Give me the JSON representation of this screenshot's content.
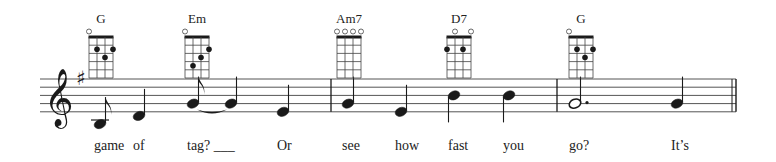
{
  "score": {
    "clef": "treble",
    "key_signature": {
      "name": "G major",
      "accidental": "sharp",
      "symbol": "♯",
      "count": 1
    },
    "measures": [
      {
        "index": 0,
        "notes": [
          {
            "pitch": "B3",
            "duration": "eighth",
            "dotted": false,
            "tie_to_next": false
          },
          {
            "pitch": "D4",
            "duration": "quarter",
            "dotted": false,
            "tie_to_next": false
          },
          {
            "pitch": "G4",
            "duration": "eighth",
            "dotted": false,
            "tie_to_next": true
          },
          {
            "pitch": "G4",
            "duration": "quarter",
            "dotted": false,
            "tie_to_next": false
          },
          {
            "pitch": "E4",
            "duration": "quarter",
            "dotted": false,
            "tie_to_next": false
          }
        ]
      },
      {
        "index": 1,
        "notes": [
          {
            "pitch": "G4",
            "duration": "quarter",
            "dotted": false,
            "tie_to_next": false
          },
          {
            "pitch": "E4",
            "duration": "quarter",
            "dotted": false,
            "tie_to_next": false
          },
          {
            "pitch": "B4",
            "duration": "quarter",
            "dotted": false,
            "tie_to_next": false
          },
          {
            "pitch": "B4",
            "duration": "quarter",
            "dotted": false,
            "tie_to_next": false
          }
        ]
      },
      {
        "index": 2,
        "notes": [
          {
            "pitch": "G4",
            "duration": "half",
            "dotted": true,
            "tie_to_next": false
          },
          {
            "pitch": "G4",
            "duration": "quarter",
            "dotted": false,
            "tie_to_next": false
          }
        ]
      }
    ],
    "final_barline": "double",
    "chords": [
      {
        "name": "G",
        "at_note": 0,
        "open": [
          true,
          false,
          false,
          false
        ],
        "fingers": [
          {
            "string": 2,
            "fret": 2
          },
          {
            "string": 3,
            "fret": 3
          },
          {
            "string": 4,
            "fret": 2
          }
        ]
      },
      {
        "name": "Em",
        "at_note": 2,
        "open": [
          true,
          false,
          false,
          false
        ],
        "fingers": [
          {
            "string": 2,
            "fret": 4
          },
          {
            "string": 3,
            "fret": 3
          },
          {
            "string": 4,
            "fret": 2
          }
        ]
      },
      {
        "name": "Am7",
        "at_note": 5,
        "open": [
          true,
          true,
          true,
          true
        ],
        "fingers": []
      },
      {
        "name": "D7",
        "at_note": 7,
        "open": [
          false,
          true,
          false,
          true
        ],
        "fingers": [
          {
            "string": 1,
            "fret": 2
          },
          {
            "string": 3,
            "fret": 2
          }
        ]
      },
      {
        "name": "G",
        "at_note": 9,
        "open": [
          true,
          false,
          false,
          false
        ],
        "fingers": [
          {
            "string": 2,
            "fret": 2
          },
          {
            "string": 3,
            "fret": 3
          },
          {
            "string": 4,
            "fret": 2
          }
        ]
      }
    ],
    "lyrics": [
      {
        "text": "game",
        "at_note": 0
      },
      {
        "text": "of",
        "at_note": 1
      },
      {
        "text": "tag? ___",
        "at_note": 2
      },
      {
        "text": "Or",
        "at_note": 4
      },
      {
        "text": "see",
        "at_note": 5
      },
      {
        "text": "how",
        "at_note": 6
      },
      {
        "text": "fast",
        "at_note": 7
      },
      {
        "text": "you",
        "at_note": 8
      },
      {
        "text": "go?",
        "at_note": 9
      },
      {
        "text": "It’s",
        "at_note": 10
      }
    ]
  },
  "colors": {
    "ink": "#1a1a1a",
    "staff": "#555555",
    "background": "#ffffff"
  }
}
